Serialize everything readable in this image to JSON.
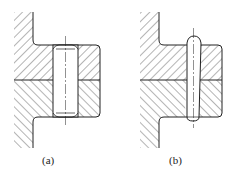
{
  "figure": {
    "panels": [
      {
        "id": "a",
        "label": "(a)",
        "pin_type": "cylindrical pin"
      },
      {
        "id": "b",
        "label": "(b)",
        "pin_type": "taper pin"
      }
    ]
  },
  "colors": {
    "line": "#222222",
    "hatch": "#444444",
    "background": "#ffffff"
  }
}
